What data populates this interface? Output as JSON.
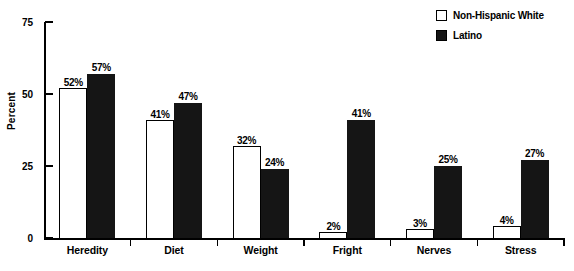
{
  "chart_data": {
    "type": "bar",
    "title": "",
    "xlabel": "",
    "ylabel": "Percent",
    "ylim": [
      0,
      75
    ],
    "yticks": [
      0,
      25,
      50,
      75
    ],
    "ytick_labels": [
      "0",
      "25",
      "50",
      "75"
    ],
    "grid": false,
    "legend_position": "top-right",
    "value_suffix": "%",
    "categories": [
      "Heredity",
      "Diet",
      "Weight",
      "Fright",
      "Nerves",
      "Stress"
    ],
    "series": [
      {
        "name": "Non-Hispanic White",
        "swatch": "hollow",
        "color": "#ffffff",
        "edge_color": "#000000",
        "values": [
          52,
          41,
          32,
          2,
          3,
          4
        ],
        "labels": [
          "52%",
          "41%",
          "32%",
          "2%",
          "3%",
          "4%"
        ]
      },
      {
        "name": "Latino",
        "swatch": "filled",
        "color": "#151515",
        "edge_color": "#151515",
        "values": [
          57,
          47,
          24,
          41,
          25,
          27
        ],
        "labels": [
          "57%",
          "47%",
          "24%",
          "41%",
          "25%",
          "27%"
        ]
      }
    ]
  },
  "legend": {
    "entries": [
      {
        "label": "Non-Hispanic White"
      },
      {
        "label": "Latino"
      }
    ]
  },
  "axes": {
    "y_title": "Percent",
    "y_tick_labels": [
      "75",
      "50",
      "25",
      "0"
    ]
  },
  "caption": {
    "text": ""
  }
}
